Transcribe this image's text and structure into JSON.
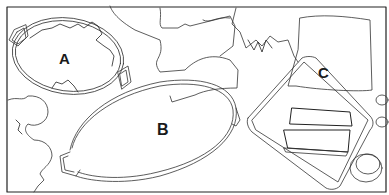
{
  "figure": {
    "type": "line-drawing illustration",
    "labels": {
      "a": "A",
      "b": "B",
      "c": "C"
    },
    "items": [
      {
        "id": "a",
        "label": "A",
        "description": "round dish with two handles, partially covered by torn shape"
      },
      {
        "id": "b",
        "label": "B",
        "description": "large oval platter with handles"
      },
      {
        "id": "c",
        "label": "C",
        "description": "rectangular board with loaf slices"
      }
    ],
    "colors": {
      "line": "#333333",
      "frame": "#222222",
      "background": "#ffffff"
    }
  }
}
